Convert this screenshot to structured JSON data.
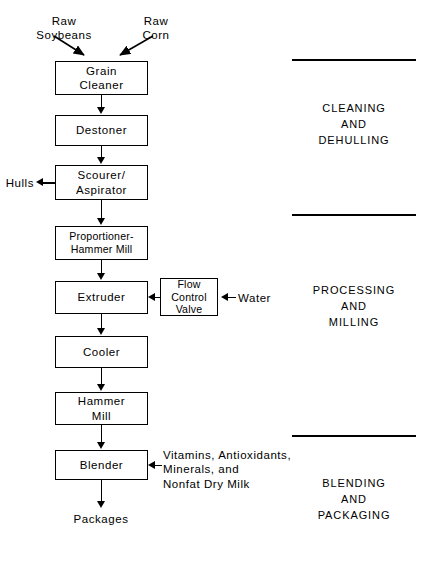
{
  "diagram": {
    "inputs": {
      "raw_soybeans": "Raw\nSoybeans",
      "raw_corn": "Raw\nCorn",
      "water": "Water",
      "additives": "Vitamins, Antioxidants,\nMinerals, and\nNonfat Dry Milk"
    },
    "outputs": {
      "hulls": "Hulls",
      "packages": "Packages"
    },
    "process_steps": [
      {
        "id": "grain-cleaner",
        "label": "Grain\nCleaner"
      },
      {
        "id": "destoner",
        "label": "Destoner"
      },
      {
        "id": "scourer-aspirator",
        "label": "Scourer/\nAspirator"
      },
      {
        "id": "proportioner-hammer-mill",
        "label": "Proportioner-\nHammer Mill"
      },
      {
        "id": "extruder",
        "label": "Extruder"
      },
      {
        "id": "cooler",
        "label": "Cooler"
      },
      {
        "id": "hammer-mill",
        "label": "Hammer\nMill"
      },
      {
        "id": "blender",
        "label": "Blender"
      }
    ],
    "auxiliary_steps": [
      {
        "id": "flow-control-valve",
        "label": "Flow\nControl\nValve"
      }
    ],
    "stages": [
      {
        "id": "cleaning-and-dehulling",
        "label": "CLEANING\nAND\nDEHULLING"
      },
      {
        "id": "processing-and-milling",
        "label": "PROCESSING\nAND\nMILLING"
      },
      {
        "id": "blending-and-packaging",
        "label": "BLENDING\nAND\nPACKAGING"
      }
    ],
    "colors": {
      "ink": "#000000",
      "paper": "#ffffff"
    }
  }
}
